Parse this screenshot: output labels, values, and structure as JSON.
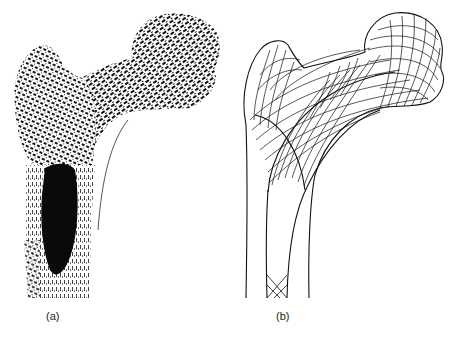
{
  "figure": {
    "panels": [
      {
        "id": "a",
        "label": "(a)",
        "content": "Photograph of sectioned proximal femur showing trabecular bone pattern and medullary cavity"
      },
      {
        "id": "b",
        "label": "(b)",
        "content": "Line drawing of trajectorial (stress) lines in the proximal femur"
      }
    ]
  },
  "colors": {
    "background": "#ffffff",
    "ink": "#111111"
  }
}
